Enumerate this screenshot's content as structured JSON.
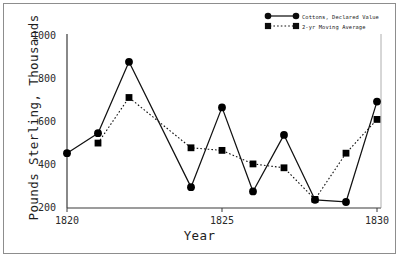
{
  "chart_data": {
    "type": "line",
    "title": "",
    "xlabel": "Year",
    "ylabel": "Pounds Sterling, Thousands",
    "xlim": [
      1819.6,
      1830.4
    ],
    "ylim": [
      200,
      1000
    ],
    "xticks": [
      1820,
      1825,
      1830
    ],
    "xticklabels": [
      "1820",
      "1825",
      "1830"
    ],
    "yticks": [
      200,
      400,
      600,
      800,
      1000
    ],
    "yticklabels": [
      "200",
      "400",
      "600",
      "800",
      "1000"
    ],
    "grid": false,
    "legend_position": "top-right",
    "x": [
      1820,
      1821,
      1822,
      1823,
      1824,
      1825,
      1826,
      1827,
      1828,
      1829,
      1830
    ],
    "series": [
      {
        "name": "Cottons, Declared Value",
        "marker": "circle",
        "linestyle": "solid",
        "color": "#000000",
        "values": [
          455,
          548,
          880,
          null,
          297,
          668,
          277,
          540,
          238,
          228,
          695
        ],
        "points_x": [
          1820,
          1821,
          1822,
          1824,
          1825,
          1826,
          1827,
          1828,
          1829,
          1830
        ],
        "points_y": [
          455,
          548,
          880,
          297,
          668,
          277,
          540,
          238,
          228,
          695
        ]
      },
      {
        "name": "2-yr Moving Average",
        "marker": "square",
        "linestyle": "dotted",
        "color": "#000000",
        "points_x": [
          1821,
          1822,
          1824,
          1825,
          1826,
          1827,
          1828,
          1829,
          1830
        ],
        "points_y": [
          502,
          714,
          480,
          468,
          405,
          387,
          240,
          455,
          612
        ]
      }
    ]
  },
  "legend": {
    "entries": [
      {
        "label": "Cottons, Declared Value"
      },
      {
        "label": "2-yr Moving Average"
      }
    ]
  }
}
